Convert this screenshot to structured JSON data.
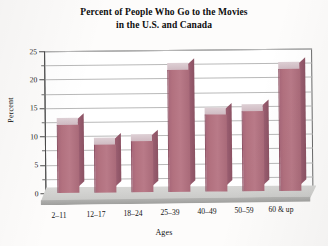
{
  "chart_data": {
    "type": "bar",
    "title": "Percent of People Who Go to the Movies in the U.S. and Canada",
    "title_line1": "Percent of People Who Go to the Movies",
    "title_line2": "in the U.S. and Canada",
    "xlabel": "Ages",
    "ylabel": "Percent",
    "categories": [
      "2–11",
      "12–17",
      "18–24",
      "25–39",
      "40–49",
      "50–59",
      "60 & up"
    ],
    "values": [
      12,
      8.5,
      9,
      21.5,
      13.5,
      14,
      21.5
    ],
    "ylim": [
      0,
      25
    ],
    "ytick_labels": [
      "0",
      "5",
      "10",
      "15",
      "20",
      "25"
    ],
    "ytick_values": [
      0,
      5,
      10,
      15,
      20,
      25
    ],
    "minor_tick_step": 2.5,
    "grid": true,
    "grid_axis": "y",
    "legend": "none",
    "style": "3d-column",
    "bar_color": "#b2717f",
    "bar_top_color": "#d9c5cc",
    "bar_side_color": "#935a6c",
    "base_color": "#cccccb",
    "grid_color": "#b9b9b9",
    "axis_color": "#4a4a4a",
    "background": "#ffffff"
  }
}
